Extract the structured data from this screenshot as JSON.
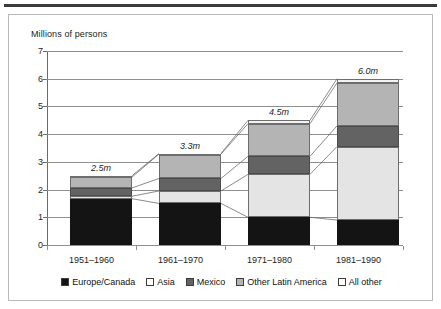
{
  "chart_data": {
    "type": "bar",
    "subtype": "stacked-bar",
    "title": "Millions of persons",
    "xlabel": "",
    "ylabel": "Millions of persons",
    "ylim": [
      0,
      7
    ],
    "yticks": [
      "0",
      "1",
      "2",
      "3",
      "4",
      "5",
      "6",
      "7"
    ],
    "grid": true,
    "legend_position": "bottom",
    "categories": [
      "1951–1960",
      "1961–1970",
      "1971–1980",
      "1981–1990"
    ],
    "series": [
      {
        "name": "Europe/Canada",
        "color": "#141414",
        "values": [
          1.67,
          1.5,
          1.0,
          0.9
        ]
      },
      {
        "name": "Asia",
        "color": "#e4e4e4",
        "values": [
          0.09,
          0.45,
          1.55,
          2.65
        ]
      },
      {
        "name": "Mexico",
        "color": "#636363",
        "values": [
          0.3,
          0.45,
          0.65,
          0.75
        ]
      },
      {
        "name": "Other Latin America",
        "color": "#b4b4b4",
        "values": [
          0.39,
          0.88,
          1.18,
          1.55
        ]
      },
      {
        "name": "All other",
        "color": "#f2f2f2",
        "values": [
          0.05,
          0.02,
          0.12,
          0.15
        ]
      }
    ],
    "totals": [
      2.5,
      3.3,
      4.5,
      6.0
    ],
    "bar_labels": [
      "2.5m",
      "3.3m",
      "4.5m",
      "6.0m"
    ],
    "annotations": [
      "2.5m",
      "3.3m",
      "4.5m",
      "6.0m"
    ]
  },
  "legend": {
    "items": [
      {
        "label": "Europe/Canada",
        "swatch": "#141414"
      },
      {
        "label": "Asia",
        "swatch": "#ffffff"
      },
      {
        "label": "Mexico",
        "swatch": "#636363"
      },
      {
        "label": "Other Latin America",
        "swatch": "#b4b4b4"
      },
      {
        "label": "All other",
        "swatch": "#ffffff"
      }
    ]
  }
}
